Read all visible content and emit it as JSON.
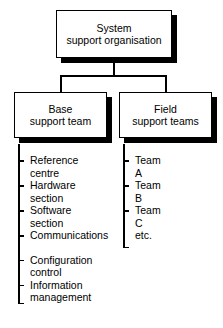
{
  "diagram": {
    "type": "organisation-chart",
    "title": "System support organisation",
    "root": {
      "id": "system-support-organisation",
      "line1": "System",
      "line2": "support organisation"
    },
    "branches": [
      {
        "id": "base-support-team",
        "line1": "Base",
        "line2": "support team",
        "items": [
          {
            "line1": "Reference",
            "line2": "centre",
            "tick": true,
            "gap_before": false
          },
          {
            "line1": "Hardware",
            "line2": "section",
            "tick": true,
            "gap_before": false
          },
          {
            "line1": "Software",
            "line2": "section",
            "tick": true,
            "gap_before": false
          },
          {
            "line1": "Communications",
            "line2": "",
            "tick": true,
            "gap_before": false
          },
          {
            "line1": "Configuration",
            "line2": "control",
            "tick": true,
            "gap_before": true
          },
          {
            "line1": "Information",
            "line2": "management",
            "tick": true,
            "gap_before": false
          }
        ]
      },
      {
        "id": "field-support-teams",
        "line1": "Field",
        "line2": "support teams",
        "items": [
          {
            "line1": "Team",
            "line2": "A",
            "tick": true,
            "gap_before": false
          },
          {
            "line1": "Team",
            "line2": "B",
            "tick": true,
            "gap_before": false
          },
          {
            "line1": "Team",
            "line2": "C",
            "tick": true,
            "gap_before": false
          },
          {
            "line1": "etc.",
            "line2": "",
            "tick": false,
            "gap_before": false
          }
        ]
      }
    ],
    "caption": "",
    "colors": {
      "ink": "#000000",
      "paper": "#ffffff",
      "shadow": "#000000"
    }
  }
}
